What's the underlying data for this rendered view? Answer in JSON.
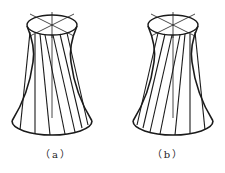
{
  "figures": [
    {
      "id": "a",
      "caption": "（a）",
      "twist": "left-to-right",
      "top_ellipse": {
        "cx": 52,
        "cy": 25,
        "rx": 25,
        "ry": 10
      },
      "bottom_ellipse": {
        "cx": 52,
        "cy": 121,
        "rx": 40,
        "ry": 14
      },
      "waist": {
        "y": 58,
        "half_width": 19
      }
    },
    {
      "id": "b",
      "caption": "（b）",
      "twist": "right-to-left",
      "top_ellipse": {
        "cx": 61,
        "cy": 25,
        "rx": 25,
        "ry": 10
      },
      "bottom_ellipse": {
        "cx": 61,
        "cy": 121,
        "rx": 40,
        "ry": 14
      },
      "waist": {
        "y": 58,
        "half_width": 19
      }
    }
  ],
  "colors": {
    "stroke": "#1a1a1a",
    "background": "#ffffff"
  }
}
